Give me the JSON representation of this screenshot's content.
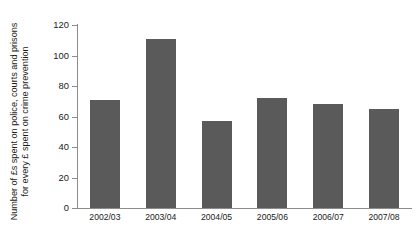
{
  "chart_data": {
    "type": "bar",
    "title": "",
    "subtitle": "",
    "xlabel": "",
    "ylabel": "Number of £s spent on police, courts and prisons for every £ spent on crime prevention",
    "ylabel_lines": [
      "Number of £s spent on police, courts and prisons",
      "for every £ spent on crime prevention"
    ],
    "categories": [
      "2002/03",
      "2003/04",
      "2004/05",
      "2005/06",
      "2006/07",
      "2007/08"
    ],
    "values": [
      71,
      111,
      57,
      72,
      68,
      65
    ],
    "ylim": [
      0,
      120
    ],
    "ytick_labels": [
      "0",
      "20",
      "40",
      "60",
      "80",
      "100",
      "120"
    ],
    "ytick_values": [
      0,
      20,
      40,
      60,
      80,
      100,
      120
    ],
    "grid": false,
    "legend": false,
    "legend_position": "none",
    "bar_color": "#5a5a5a",
    "axis_color": "#8c8c8c",
    "background_color": "#ffffff"
  }
}
